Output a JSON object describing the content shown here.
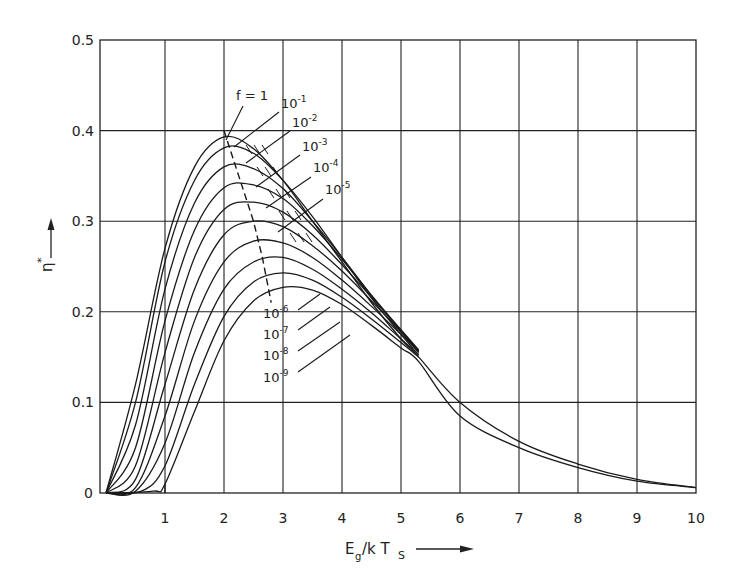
{
  "chart_data": {
    "type": "line",
    "title": "",
    "xlabel": "E_g/kT_s",
    "ylabel": "η*",
    "xlim": [
      0,
      10
    ],
    "ylim": [
      0,
      0.5
    ],
    "grid": true,
    "legend": "inline curve labels",
    "x_ticks": [
      "1",
      "2",
      "3",
      "4",
      "5",
      "6",
      "7",
      "8",
      "9",
      "10"
    ],
    "y_ticks": [
      "0",
      "0.1",
      "0.2",
      "0.3",
      "0.4",
      "0.5"
    ],
    "series": [
      {
        "name": "f = 1",
        "label": "f = 1",
        "peak_x": 2.05,
        "peak_y": 0.393,
        "points": [
          [
            0,
            0
          ],
          [
            0.5,
            0.12
          ],
          [
            1,
            0.27
          ],
          [
            1.5,
            0.36
          ],
          [
            2,
            0.393
          ],
          [
            2.5,
            0.38
          ],
          [
            3,
            0.345
          ],
          [
            3.5,
            0.3
          ],
          [
            4,
            0.255
          ],
          [
            4.5,
            0.21
          ],
          [
            5,
            0.17
          ],
          [
            5.3,
            0.15
          ],
          [
            6,
            0.1
          ],
          [
            7,
            0.057
          ],
          [
            8,
            0.032
          ],
          [
            9,
            0.015
          ],
          [
            10,
            0.006
          ]
        ]
      },
      {
        "name": "10^-1",
        "label": "10",
        "exp": "-1",
        "peak_x": 2.1,
        "peak_y": 0.383,
        "points": [
          [
            0,
            0
          ],
          [
            0.5,
            0.1
          ],
          [
            1,
            0.255
          ],
          [
            1.5,
            0.345
          ],
          [
            2,
            0.381
          ],
          [
            2.5,
            0.375
          ],
          [
            3,
            0.345
          ],
          [
            3.5,
            0.305
          ],
          [
            4,
            0.26
          ],
          [
            4.5,
            0.215
          ],
          [
            5,
            0.175
          ],
          [
            5.3,
            0.152
          ]
        ]
      },
      {
        "name": "10^-2",
        "label": "10",
        "exp": "-2",
        "peak_x": 2.2,
        "peak_y": 0.362,
        "points": [
          [
            0,
            0
          ],
          [
            0.5,
            0.075
          ],
          [
            1,
            0.225
          ],
          [
            1.5,
            0.32
          ],
          [
            2,
            0.36
          ],
          [
            2.5,
            0.358
          ],
          [
            3,
            0.336
          ],
          [
            3.5,
            0.3
          ],
          [
            4,
            0.26
          ],
          [
            4.5,
            0.218
          ],
          [
            5,
            0.178
          ],
          [
            5.3,
            0.155
          ]
        ]
      },
      {
        "name": "10^-3",
        "label": "10",
        "exp": "-3",
        "peak_x": 2.3,
        "peak_y": 0.342,
        "points": [
          [
            0,
            0
          ],
          [
            0.5,
            0.05
          ],
          [
            1,
            0.19
          ],
          [
            1.5,
            0.29
          ],
          [
            2,
            0.337
          ],
          [
            2.5,
            0.34
          ],
          [
            3,
            0.325
          ],
          [
            3.5,
            0.295
          ],
          [
            4,
            0.258
          ],
          [
            4.5,
            0.218
          ],
          [
            5,
            0.18
          ],
          [
            5.3,
            0.157
          ]
        ]
      },
      {
        "name": "10^-4",
        "label": "10",
        "exp": "-4",
        "peak_x": 2.4,
        "peak_y": 0.322,
        "points": [
          [
            0,
            0
          ],
          [
            0.5,
            0.03
          ],
          [
            1,
            0.155
          ],
          [
            1.5,
            0.26
          ],
          [
            2,
            0.313
          ],
          [
            2.5,
            0.321
          ],
          [
            3,
            0.31
          ],
          [
            3.5,
            0.285
          ],
          [
            4,
            0.252
          ],
          [
            4.5,
            0.216
          ],
          [
            5,
            0.18
          ],
          [
            5.3,
            0.158
          ]
        ]
      },
      {
        "name": "10^-5",
        "label": "10",
        "exp": "-5",
        "peak_x": 2.5,
        "peak_y": 0.3,
        "points": [
          [
            0,
            0
          ],
          [
            0.5,
            0.015
          ],
          [
            1,
            0.12
          ],
          [
            1.5,
            0.225
          ],
          [
            2,
            0.285
          ],
          [
            2.5,
            0.3
          ],
          [
            3,
            0.294
          ],
          [
            3.5,
            0.273
          ],
          [
            4,
            0.245
          ],
          [
            4.5,
            0.212
          ],
          [
            5,
            0.178
          ],
          [
            5.3,
            0.157
          ]
        ]
      },
      {
        "name": "10^-6",
        "label": "10",
        "exp": "-6",
        "peak_x": 2.6,
        "peak_y": 0.279,
        "points": [
          [
            0,
            0
          ],
          [
            0.5,
            0.006
          ],
          [
            1,
            0.085
          ],
          [
            1.5,
            0.19
          ],
          [
            2,
            0.255
          ],
          [
            2.5,
            0.278
          ],
          [
            3,
            0.276
          ],
          [
            3.5,
            0.26
          ],
          [
            4,
            0.235
          ],
          [
            4.5,
            0.206
          ],
          [
            5,
            0.175
          ],
          [
            5.3,
            0.156
          ]
        ]
      },
      {
        "name": "10^-7",
        "label": "10",
        "exp": "-7",
        "peak_x": 2.7,
        "peak_y": 0.262,
        "points": [
          [
            0,
            0
          ],
          [
            0.5,
            0.002
          ],
          [
            1,
            0.055
          ],
          [
            1.5,
            0.155
          ],
          [
            2,
            0.225
          ],
          [
            2.5,
            0.255
          ],
          [
            3,
            0.26
          ],
          [
            3.5,
            0.247
          ],
          [
            4,
            0.225
          ],
          [
            4.5,
            0.199
          ],
          [
            5,
            0.17
          ],
          [
            5.3,
            0.153
          ]
        ]
      },
      {
        "name": "10^-8",
        "label": "10",
        "exp": "-8",
        "peak_x": 2.75,
        "peak_y": 0.244,
        "points": [
          [
            0,
            0
          ],
          [
            0.6,
            0.002
          ],
          [
            1,
            0.03
          ],
          [
            1.5,
            0.12
          ],
          [
            2,
            0.195
          ],
          [
            2.5,
            0.233
          ],
          [
            3,
            0.243
          ],
          [
            3.5,
            0.235
          ],
          [
            4,
            0.216
          ],
          [
            4.5,
            0.192
          ],
          [
            5,
            0.166
          ],
          [
            5.3,
            0.15
          ]
        ]
      },
      {
        "name": "10^-9",
        "label": "10",
        "exp": "-9",
        "peak_x": 2.85,
        "peak_y": 0.228,
        "points": [
          [
            0,
            0
          ],
          [
            0.8,
            0.002
          ],
          [
            1,
            0.01
          ],
          [
            1.5,
            0.09
          ],
          [
            2,
            0.168
          ],
          [
            2.5,
            0.212
          ],
          [
            3,
            0.227
          ],
          [
            3.5,
            0.224
          ],
          [
            4,
            0.208
          ],
          [
            4.5,
            0.185
          ],
          [
            5,
            0.16
          ],
          [
            5.3,
            0.145
          ],
          [
            6,
            0.085
          ],
          [
            7,
            0.05
          ],
          [
            8,
            0.028
          ],
          [
            9,
            0.013
          ],
          [
            10,
            0.006
          ]
        ]
      }
    ],
    "annotations": {
      "dashed_locus_of_maxima": [
        [
          2.0,
          0.4
        ],
        [
          2.3,
          0.34
        ],
        [
          2.5,
          0.3
        ],
        [
          2.65,
          0.26
        ],
        [
          2.8,
          0.21
        ]
      ],
      "boundary_line_x1": [
        [
          1.0,
          0.0
        ],
        [
          1.0,
          0.01
        ]
      ]
    }
  },
  "labels": {
    "x_title_main": "E",
    "x_title_sub1": "g",
    "x_title_mid": "/k T",
    "x_title_sub2": "S",
    "y_title": "η",
    "y_title_sup": "*"
  },
  "label_positions": [
    {
      "series": 0,
      "tx": 236,
      "ty": 100,
      "lx1": 243,
      "ly1": 106,
      "lx2": 226,
      "ly2": 140
    },
    {
      "series": 1,
      "tx": 281,
      "ty": 108,
      "lx1": 279,
      "ly1": 112,
      "lx2": 234,
      "ly2": 147
    },
    {
      "series": 2,
      "tx": 292,
      "ty": 127,
      "lx1": 290,
      "ly1": 131,
      "lx2": 246,
      "ly2": 163
    },
    {
      "series": 3,
      "tx": 302,
      "ty": 151,
      "lx1": 300,
      "ly1": 155,
      "lx2": 256,
      "ly2": 187
    },
    {
      "series": 4,
      "tx": 313,
      "ty": 172,
      "lx1": 311,
      "ly1": 177,
      "lx2": 266,
      "ly2": 208
    },
    {
      "series": 5,
      "tx": 325,
      "ty": 194,
      "lx1": 323,
      "ly1": 199,
      "lx2": 278,
      "ly2": 232
    },
    {
      "series": 6,
      "tx": 263,
      "ty": 318,
      "lx1": 298,
      "ly1": 310,
      "lx2": 320,
      "ly2": 294
    },
    {
      "series": 7,
      "tx": 263,
      "ty": 339,
      "lx1": 298,
      "ly1": 330,
      "lx2": 330,
      "ly2": 307
    },
    {
      "series": 8,
      "tx": 263,
      "ty": 360,
      "lx1": 298,
      "ly1": 351,
      "lx2": 340,
      "ly2": 322
    },
    {
      "series": 9,
      "tx": 263,
      "ty": 382,
      "lx1": 298,
      "ly1": 372,
      "lx2": 350,
      "ly2": 335
    }
  ]
}
